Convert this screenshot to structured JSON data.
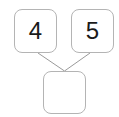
{
  "diagram": {
    "type": "number-bond",
    "orientation": "two-addends-above-sum-below",
    "background_color": "#ffffff",
    "line_color": "#9a9a9a",
    "border_color": "#b4b4b4",
    "text_color": "#1a1a1a",
    "nodes": [
      {
        "id": "addend-1",
        "role": "addend",
        "value": "4",
        "empty": false,
        "x": 14,
        "y": 9,
        "width": 43,
        "height": 44
      },
      {
        "id": "addend-2",
        "role": "addend",
        "value": "5",
        "empty": false,
        "x": 71,
        "y": 9,
        "width": 43,
        "height": 44
      },
      {
        "id": "sum",
        "role": "sum",
        "value": "",
        "empty": true,
        "x": 43,
        "y": 71,
        "width": 43,
        "height": 43
      }
    ],
    "connectors": [
      {
        "id": "connector-left",
        "from": "addend-1",
        "to": "sum",
        "x1": 38,
        "y1": 53,
        "x2": 64.5,
        "y2": 71
      },
      {
        "id": "connector-right",
        "from": "addend-2",
        "to": "sum",
        "x1": 90,
        "y1": 53,
        "x2": 64.5,
        "y2": 71
      }
    ]
  }
}
